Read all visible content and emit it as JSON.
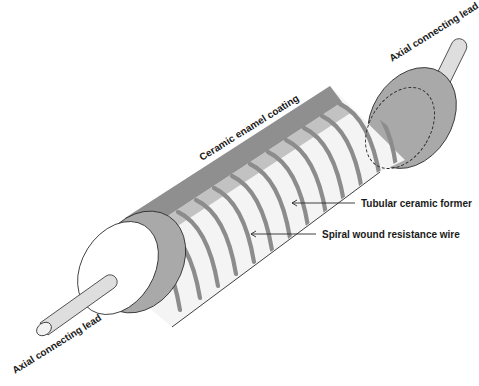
{
  "diagram": {
    "colors": {
      "coating": "#8f8f8f",
      "cap": "#a9a9a9",
      "former": "#f4f4f4",
      "wire": "#8c8c8c",
      "lead": "#dedede",
      "outline": "#2a2a2a",
      "background": "#ffffff"
    },
    "labels": {
      "coating": "Ceramic enamel coating",
      "former": "Tubular ceramic former",
      "wire": "Spiral wound resistance wire",
      "lead_right": "Axial connecting lead",
      "lead_left": "Axial connecting lead"
    }
  }
}
